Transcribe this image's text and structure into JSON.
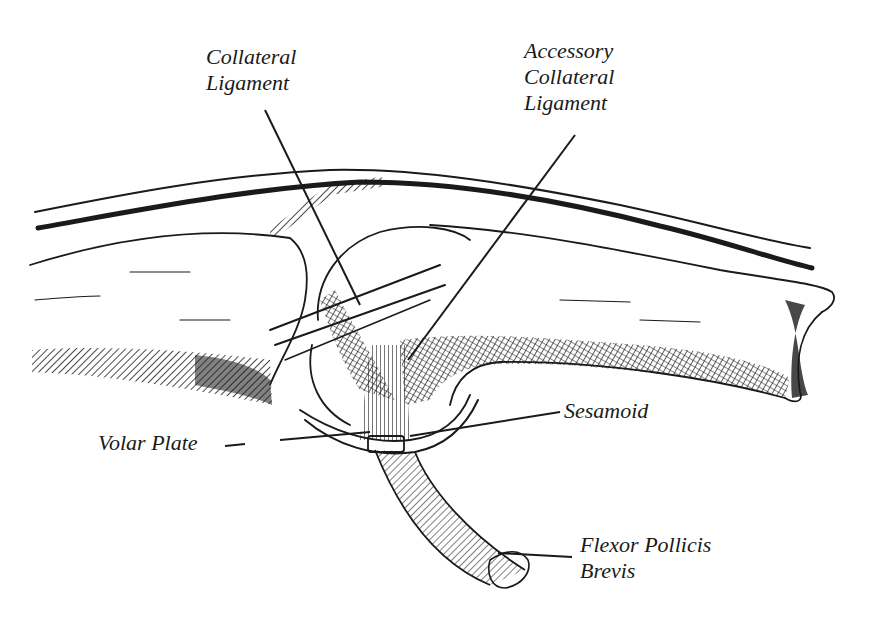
{
  "diagram": {
    "labels": [
      {
        "id": "collateral-ligament",
        "lines": [
          "Collateral",
          "Ligament"
        ]
      },
      {
        "id": "accessory-collateral-ligament",
        "lines": [
          "Accessory",
          "Collateral",
          "Ligament"
        ]
      },
      {
        "id": "sesamoid",
        "lines": [
          "Sesamoid"
        ]
      },
      {
        "id": "volar-plate",
        "lines": [
          "Volar Plate"
        ]
      },
      {
        "id": "flexor-pollicis-brevis",
        "lines": [
          "Flexor Pollicis",
          "Brevis"
        ]
      }
    ],
    "colors": {
      "ink": "#1a1a1a",
      "background": "#ffffff"
    }
  }
}
